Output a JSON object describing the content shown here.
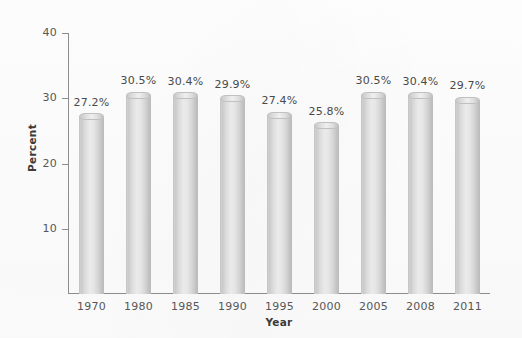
{
  "chart_data": {
    "type": "bar",
    "title": "",
    "subtitle": "",
    "xlabel": "Year",
    "ylabel": "Percent",
    "categories": [
      "1970",
      "1980",
      "1985",
      "1990",
      "1995",
      "2000",
      "2005",
      "2008",
      "2011"
    ],
    "values": [
      27.2,
      30.5,
      30.4,
      29.9,
      27.4,
      25.8,
      30.5,
      30.4,
      29.7
    ],
    "data_labels": [
      "27.2%",
      "30.5%",
      "30.4%",
      "29.9%",
      "27.4%",
      "25.8%",
      "30.5%",
      "30.4%",
      "29.7%"
    ],
    "ylim": [
      0,
      40
    ],
    "ytick_values": [
      10,
      20,
      30,
      40
    ],
    "ytick_labels": [
      "10",
      "20",
      "30",
      "40"
    ],
    "grid": false,
    "legend": null,
    "legend_position": "none",
    "bar_style": "cylinder",
    "colors": {
      "bar_light": "#eaeaea",
      "bar_mid": "#d6d6d6",
      "bar_dark": "#bdbdbd",
      "axis": "#8d8d8d",
      "tick_text": "#575757",
      "axis_title": "#3b3b3b",
      "value_text": "#4a4a4a",
      "background": "#fefefe"
    }
  },
  "axes": {
    "y_title": "Percent",
    "x_title": "Year"
  }
}
